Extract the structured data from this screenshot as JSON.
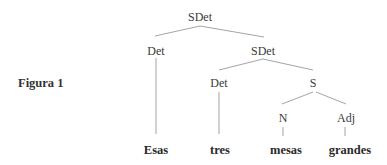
{
  "figure": {
    "caption": "Figura 1"
  },
  "tree": {
    "root": {
      "label": "SDet"
    },
    "det1": {
      "label": "Det"
    },
    "sdet2": {
      "label": "SDet"
    },
    "det2": {
      "label": "Det"
    },
    "s": {
      "label": "S"
    },
    "n": {
      "label": "N"
    },
    "adj": {
      "label": "Adj"
    }
  },
  "leaves": [
    {
      "word": "Esas"
    },
    {
      "word": "tres"
    },
    {
      "word": "mesas"
    },
    {
      "word": "grandes"
    }
  ],
  "colors": {
    "line": "#9a9a9a",
    "text": "#2e2e2e",
    "background": "#ffffff"
  }
}
